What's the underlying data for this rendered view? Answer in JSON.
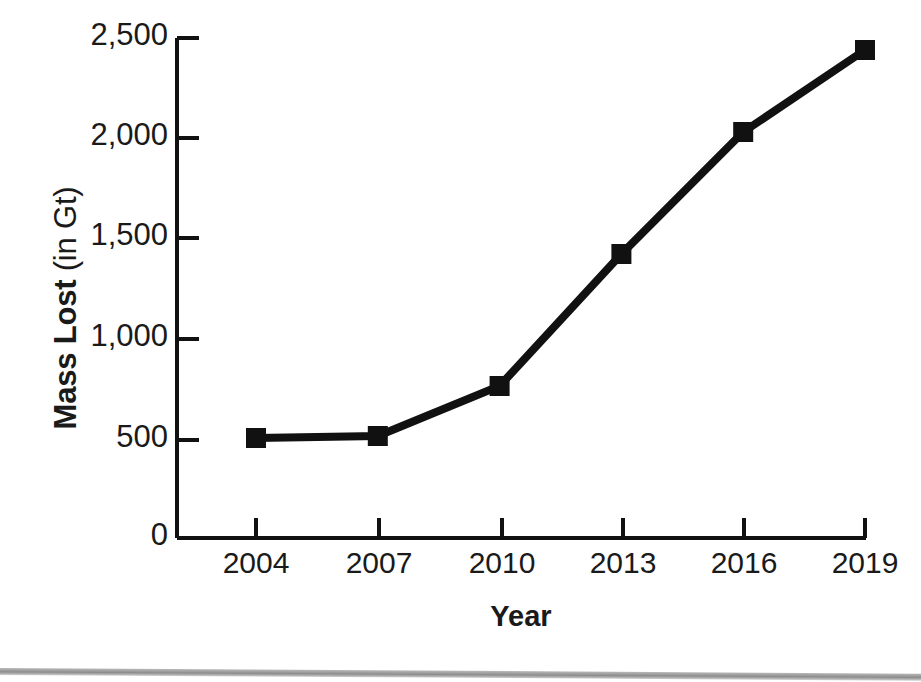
{
  "chart_data": {
    "type": "line",
    "title": "",
    "xlabel": "Year",
    "ylabel": "Mass Lost (in Gt)",
    "ylabel_bold_part": "Mass Lost",
    "ylabel_light_part": "(in Gt)",
    "categories": [
      "2004",
      "2007",
      "2010",
      "2013",
      "2016",
      "2019"
    ],
    "x": [
      2004,
      2007,
      2010,
      2013,
      2016,
      2019
    ],
    "values": [
      500,
      510,
      760,
      1420,
      2030,
      2440
    ],
    "series": [
      {
        "name": "Mass Lost",
        "values": [
          500,
          510,
          760,
          1420,
          2030,
          2440
        ]
      }
    ],
    "xlim": [
      2003,
      2019
    ],
    "ylim": [
      0,
      2500
    ],
    "ytick_values": [
      0,
      500,
      1000,
      1500,
      2000,
      2500
    ],
    "ytick_labels": [
      "0",
      "500",
      "1,000",
      "1,500",
      "2,000",
      "2,500"
    ],
    "xtick_labels": [
      "2004",
      "2007",
      "2010",
      "2013",
      "2016",
      "2019"
    ],
    "grid": false,
    "legend": false,
    "legend_position": "none",
    "marker": "square",
    "line_color": "#111111",
    "marker_color": "#111111",
    "axis_color": "#111111",
    "background_color": "#ffffff"
  },
  "axes": {
    "y_title_strong": "Mass Lost",
    "y_title_light": "(in Gt)",
    "x_title": "Year"
  },
  "ytick_labels": {
    "t0": "0",
    "t1": "500",
    "t2": "1,000",
    "t3": "1,500",
    "t4": "2,000",
    "t5": "2,500"
  },
  "xtick_labels": {
    "t0": "2004",
    "t1": "2007",
    "t2": "2010",
    "t3": "2013",
    "t4": "2016",
    "t5": "2019"
  }
}
